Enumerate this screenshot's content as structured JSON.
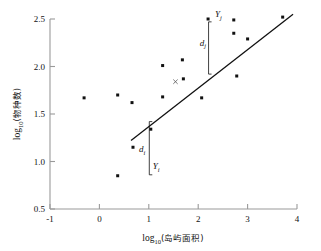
{
  "chart_data": {
    "type": "scatter",
    "title": "",
    "xlabel": "log10(岛屿面积)",
    "xlabel_base": "log",
    "xlabel_sub": "10",
    "xlabel_paren": "(岛屿面积)",
    "ylabel": "log10(物种数)",
    "ylabel_base": "log",
    "ylabel_sub": "10",
    "ylabel_paren": "(物种数)",
    "xlim": [
      -1,
      4
    ],
    "ylim": [
      0.5,
      2.5
    ],
    "xticks": [
      -1,
      0,
      1,
      2,
      3,
      4
    ],
    "xtick_labels": [
      "-1",
      "0",
      "1",
      "2",
      "3",
      "4"
    ],
    "yticks": [
      0.5,
      1.0,
      1.5,
      2.0,
      2.5
    ],
    "ytick_labels": [
      "0.5",
      "1.0",
      "1.5",
      "2.0",
      "2.5"
    ],
    "grid": false,
    "legend": "none",
    "points": [
      {
        "x": -0.31,
        "y": 1.67
      },
      {
        "x": 0.37,
        "y": 1.7
      },
      {
        "x": 0.37,
        "y": 0.85
      },
      {
        "x": 0.66,
        "y": 1.62
      },
      {
        "x": 0.68,
        "y": 1.15
      },
      {
        "x": 1.04,
        "y": 1.34
      },
      {
        "x": 1.28,
        "y": 2.01
      },
      {
        "x": 1.28,
        "y": 1.68
      },
      {
        "x": 1.68,
        "y": 2.07
      },
      {
        "x": 1.7,
        "y": 1.87
      },
      {
        "x": 2.07,
        "y": 1.67
      },
      {
        "x": 2.2,
        "y": 2.5
      },
      {
        "x": 2.72,
        "y": 2.49
      },
      {
        "x": 2.72,
        "y": 2.35
      },
      {
        "x": 2.78,
        "y": 1.9
      },
      {
        "x": 3.0,
        "y": 2.29
      },
      {
        "x": 3.71,
        "y": 2.52
      }
    ],
    "regression_line": {
      "x_start": 0.64,
      "y_start": 1.22,
      "x_end": 3.92,
      "y_end": 2.55
    },
    "centroid_marker": {
      "x": 1.54,
      "y": 1.84,
      "symbol": "x"
    },
    "annotations": [
      {
        "name": "d_i",
        "label_base": "d",
        "label_sub": "i",
        "x": 0.8,
        "y": 1.1
      },
      {
        "name": "Y_i",
        "label_base": "Y",
        "label_sub": "i",
        "x": 1.08,
        "y": 0.92
      },
      {
        "name": "d_j",
        "label_base": "d",
        "label_sub": "j",
        "x": 2.03,
        "y": 2.22
      },
      {
        "name": "Y_j",
        "label_base": "Y",
        "label_sub": "j",
        "x": 2.34,
        "y": 2.52
      }
    ],
    "braces": [
      {
        "name": "brace-di",
        "x": 1.01,
        "y_top": 1.42,
        "y_bottom": 0.86
      },
      {
        "name": "brace-dj",
        "x": 2.21,
        "y_top": 2.47,
        "y_bottom": 1.92
      }
    ]
  }
}
